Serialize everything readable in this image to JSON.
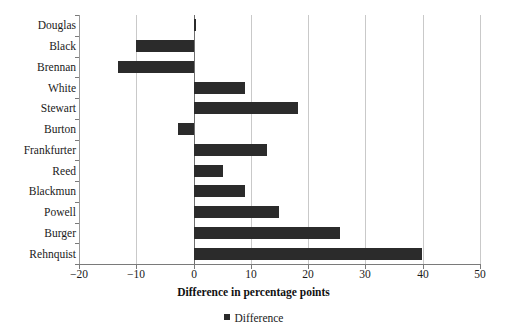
{
  "chart_data": {
    "type": "bar",
    "orientation": "horizontal",
    "title": "",
    "subtitle": "",
    "xlabel": "Difference in percentage points",
    "ylabel": "",
    "xlim": [
      -20,
      50
    ],
    "xticks": [
      -20,
      -10,
      0,
      10,
      20,
      30,
      40,
      50
    ],
    "xtick_labels": [
      "−20",
      "−10",
      "0",
      "10",
      "20",
      "30",
      "40",
      "50"
    ],
    "grid": "vertical",
    "legend": {
      "position": "bottom",
      "entries": [
        {
          "label": "Difference",
          "color": "#2b2b2b",
          "marker": "square"
        }
      ]
    },
    "categories": [
      "Douglas",
      "Black",
      "Brennan",
      "White",
      "Stewart",
      "Burton",
      "Frankfurter",
      "Reed",
      "Blackmun",
      "Powell",
      "Burger",
      "Rehnquist"
    ],
    "series": [
      {
        "name": "Difference",
        "color": "#2b2b2b",
        "values": [
          0.5,
          -10.0,
          -13.2,
          9.0,
          18.2,
          -2.8,
          12.8,
          5.2,
          9.0,
          14.9,
          25.5,
          39.8
        ]
      }
    ]
  },
  "axis": {
    "x_title": "Difference in percentage points"
  }
}
